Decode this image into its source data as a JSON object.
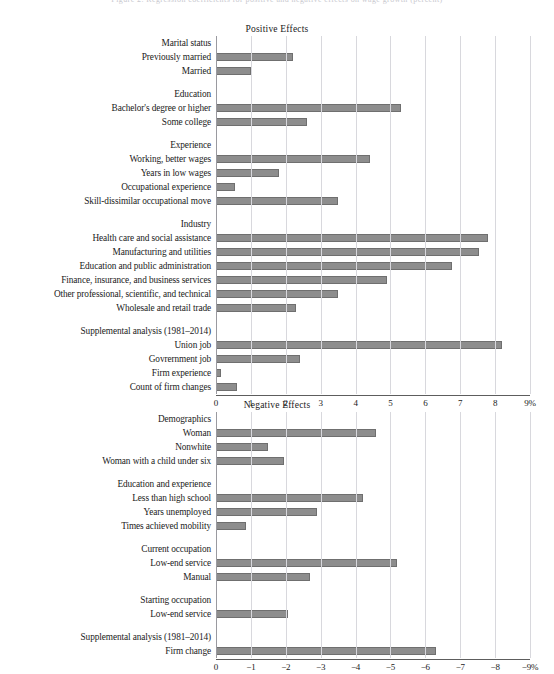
{
  "top_caption": "Figure 2. Regression coefficients for positive and negative effects on wage growth (percent)",
  "chart_data": [
    {
      "type": "bar",
      "orientation": "horizontal",
      "title": "Positive Effects",
      "xlabel": "",
      "ylabel": "",
      "xlim": [
        0,
        9
      ],
      "unit": "%",
      "grid": true,
      "axis_suffix": "%",
      "ticks": [
        "0",
        "1",
        "2",
        "3",
        "4",
        "5",
        "6",
        "7",
        "8",
        "9%"
      ],
      "tick_values": [
        0,
        1,
        2,
        3,
        4,
        5,
        6,
        7,
        8,
        9
      ],
      "items": [
        {
          "label": "Marital status",
          "group": true
        },
        {
          "label": "Previously married",
          "value": 2.2
        },
        {
          "label": "Married",
          "value": 1.0
        },
        {
          "spacer": true
        },
        {
          "label": "Education",
          "group": true
        },
        {
          "label": "Bachelor's degree or higher",
          "value": 5.3
        },
        {
          "label": "Some college",
          "value": 2.6
        },
        {
          "spacer": true
        },
        {
          "label": "Experience",
          "group": true
        },
        {
          "label": "Working, better wages",
          "value": 4.4
        },
        {
          "label": "Years in low wages",
          "value": 1.8
        },
        {
          "label": "Occupational experience",
          "value": 0.55
        },
        {
          "label": "Skill-dissimilar occupational move",
          "value": 3.5
        },
        {
          "spacer": true
        },
        {
          "label": "Industry",
          "group": true
        },
        {
          "label": "Health care and social assistance",
          "value": 7.8
        },
        {
          "label": "Manufacturing and utilities",
          "value": 7.55
        },
        {
          "label": "Education and public administration",
          "value": 6.75
        },
        {
          "label": "Finance, insurance, and business services",
          "value": 4.9
        },
        {
          "label": "Other professional, scientific, and technical",
          "value": 3.5
        },
        {
          "label": "Wholesale and retail trade",
          "value": 2.3
        },
        {
          "spacer": true
        },
        {
          "label": "Supplemental analysis (1981–2014)",
          "group": true
        },
        {
          "label": "Union job",
          "value": 8.2
        },
        {
          "label": "Govrernment job",
          "value": 2.4
        },
        {
          "label": "Firm experience",
          "value": 0.15
        },
        {
          "label": "Count of firm changes",
          "value": 0.6
        }
      ]
    },
    {
      "type": "bar",
      "orientation": "horizontal",
      "title": "Negative Effects",
      "xlabel": "",
      "ylabel": "",
      "xlim": [
        0,
        9
      ],
      "unit": "%",
      "grid": true,
      "axis_suffix": "%",
      "ticks": [
        "0",
        "−1",
        "−2",
        "−3",
        "−4",
        "−5",
        "−6",
        "−7",
        "−8",
        "−9%"
      ],
      "tick_values": [
        0,
        -1,
        -2,
        -3,
        -4,
        -5,
        -6,
        -7,
        -8,
        -9
      ],
      "items": [
        {
          "label": "Demographics",
          "group": true
        },
        {
          "label": "Woman",
          "value": 4.6
        },
        {
          "label": "Nonwhite",
          "value": 1.5
        },
        {
          "label": "Woman with a child under six",
          "value": 1.95
        },
        {
          "spacer": true
        },
        {
          "label": "Education and experience",
          "group": true
        },
        {
          "label": "Less than high school",
          "value": 4.2
        },
        {
          "label": "Years unemployed",
          "value": 2.9
        },
        {
          "label": "Times achieved mobility",
          "value": 0.85
        },
        {
          "spacer": true
        },
        {
          "label": "Current occupation",
          "group": true
        },
        {
          "label": "Low-end service",
          "value": 5.2
        },
        {
          "label": "Manual",
          "value": 2.7
        },
        {
          "spacer": true
        },
        {
          "label": "Starting occupation",
          "group": true
        },
        {
          "label": "Low-end service",
          "value": 2.05
        },
        {
          "spacer": true
        },
        {
          "label": "Supplemental analysis (1981–2014)",
          "group": true
        },
        {
          "label": "Firm change",
          "value": 6.3
        }
      ]
    }
  ],
  "style": {
    "bar_fill": "#8d8d8d",
    "bar_border": "#6f6f6f",
    "gridline": "#d8d8dd",
    "axis_line": "#5d5d5d",
    "text": "#1a1a1a"
  }
}
